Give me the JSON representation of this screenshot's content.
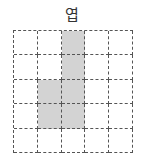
{
  "title": "엽",
  "grid": {
    "rows": 5,
    "cols": 5,
    "fill_color": "#d3d3d3",
    "line_color": "#555555",
    "cells": [
      [
        0,
        0,
        1,
        0,
        0
      ],
      [
        0,
        0,
        1,
        0,
        0
      ],
      [
        0,
        1,
        1,
        0,
        0
      ],
      [
        0,
        1,
        1,
        0,
        0
      ],
      [
        0,
        0,
        0,
        0,
        0
      ]
    ]
  }
}
